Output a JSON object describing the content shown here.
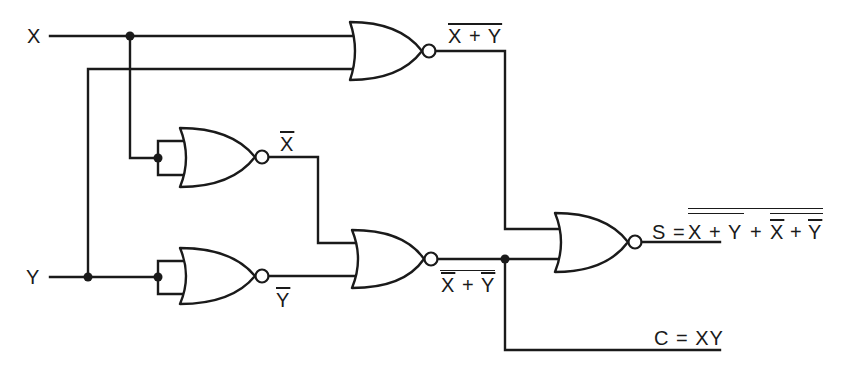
{
  "diagram": {
    "type": "logic-circuit",
    "colors": {
      "ink": "#1a1a1a",
      "background": "#ffffff"
    },
    "inputs": {
      "x": "X",
      "y": "Y"
    },
    "gates": [
      {
        "id": "nor1",
        "kind": "NOR",
        "inputs": [
          "X",
          "Y"
        ],
        "output_label": {
          "text": "X + Y",
          "overline_levels": 1
        }
      },
      {
        "id": "nor2",
        "kind": "NOR",
        "inputs": [
          "X",
          "X"
        ],
        "output_label": {
          "text": "X",
          "overline_levels": 1
        }
      },
      {
        "id": "nor3",
        "kind": "NOR",
        "inputs": [
          "Y",
          "Y"
        ],
        "output_label": {
          "text": "Y",
          "overline_levels": 1
        }
      },
      {
        "id": "nor4",
        "kind": "NOR",
        "inputs": [
          "X̄",
          "Ȳ"
        ],
        "output_label": {
          "text": "X + Y",
          "overline_levels": 2
        }
      },
      {
        "id": "nor5",
        "kind": "NOR",
        "inputs": [
          "nor1",
          "nor4"
        ],
        "output_label": {
          "text": "S = X + Y + X + Y",
          "overline_levels": 2
        }
      }
    ],
    "labels": {
      "x_input": "X",
      "y_input": "Y",
      "nor1_out": "X + Y",
      "x_bar": "X",
      "y_bar": "Y",
      "nor4_out_x": "X",
      "nor4_out_plus": "+",
      "nor4_out_y": "Y",
      "sum_prefix": "S =",
      "sum_x": "X",
      "sum_plus1": "+",
      "sum_y": "Y",
      "sum_plus2": "+",
      "sum_xbar": "X",
      "sum_plus3": "+",
      "sum_ybar": "Y",
      "carry": "C = XY"
    },
    "outputs": {
      "sum": "S = ¬(¬(X+Y) + ¬(¬X+¬Y))",
      "carry": "C = XY"
    }
  }
}
